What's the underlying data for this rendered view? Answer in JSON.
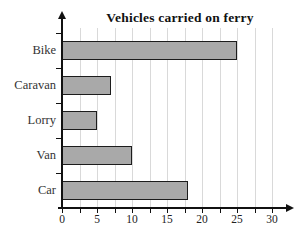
{
  "chart_data": {
    "type": "bar",
    "orientation": "horizontal",
    "title": "Vehicles carried on ferry",
    "categories": [
      "Bike",
      "Caravan",
      "Lorry",
      "Van",
      "Car"
    ],
    "values": [
      25,
      7,
      5,
      10,
      18
    ],
    "xlabel": "",
    "ylabel": "",
    "xlim": [
      0,
      30
    ],
    "x_tick_labels": [
      "0",
      "5",
      "10",
      "15",
      "20",
      "25",
      "30"
    ],
    "x_major_tick_step": 5,
    "x_minor_tick_step": 2.5,
    "grid": true,
    "legend": "none",
    "colors": {
      "bar_fill": "#a9a9a9",
      "bar_border": "#1c1c1c",
      "gridline": "#d9d9d9",
      "axis": "#111111",
      "label_text": "#333333",
      "tick_text": "#222222",
      "background": "#ffffff"
    }
  }
}
